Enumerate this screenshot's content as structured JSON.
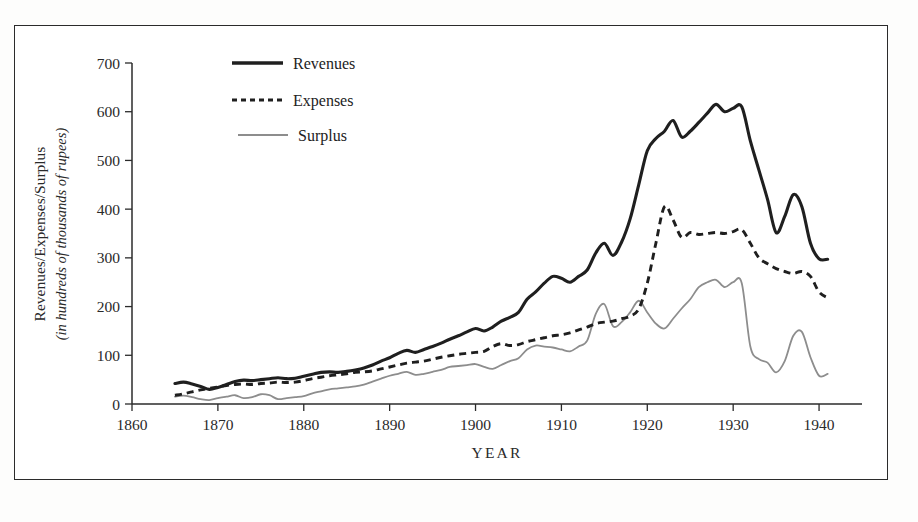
{
  "chart_data": {
    "type": "line",
    "title": "",
    "xlabel": "YEAR",
    "ylabel": "Revenues/Expenses/Surplus",
    "ylabel_sub": "(in hundreds of thousands of rupees)",
    "xlim": [
      1860,
      1945
    ],
    "ylim": [
      0,
      700
    ],
    "xticks": [
      1860,
      1870,
      1880,
      1890,
      1900,
      1910,
      1920,
      1930,
      1940
    ],
    "yticks": [
      0,
      100,
      200,
      300,
      400,
      500,
      600,
      700
    ],
    "grid": false,
    "legend_position": "top-center",
    "colors": {
      "revenues": "#1f1f1f",
      "expenses": "#1f1f1f",
      "surplus": "#8d8d8d",
      "axis": "#2b2b2b",
      "background": "#ffffff"
    },
    "x": [
      1865,
      1866,
      1867,
      1868,
      1869,
      1870,
      1871,
      1872,
      1873,
      1874,
      1875,
      1876,
      1877,
      1878,
      1879,
      1880,
      1881,
      1882,
      1883,
      1884,
      1885,
      1886,
      1887,
      1888,
      1889,
      1890,
      1891,
      1892,
      1893,
      1894,
      1895,
      1896,
      1897,
      1898,
      1899,
      1900,
      1901,
      1902,
      1903,
      1904,
      1905,
      1906,
      1907,
      1908,
      1909,
      1910,
      1911,
      1912,
      1913,
      1914,
      1915,
      1916,
      1917,
      1918,
      1919,
      1920,
      1921,
      1922,
      1923,
      1924,
      1925,
      1926,
      1927,
      1928,
      1929,
      1930,
      1931,
      1932,
      1933,
      1934,
      1935,
      1936,
      1937,
      1938,
      1939,
      1940,
      1941
    ],
    "series": [
      {
        "name": "Revenues",
        "style": "solid-thick",
        "values": [
          42,
          45,
          41,
          36,
          30,
          34,
          40,
          46,
          49,
          48,
          50,
          52,
          54,
          52,
          53,
          57,
          61,
          65,
          66,
          65,
          67,
          70,
          74,
          80,
          88,
          95,
          104,
          110,
          106,
          112,
          118,
          125,
          133,
          140,
          148,
          155,
          150,
          158,
          170,
          178,
          188,
          215,
          230,
          248,
          262,
          258,
          250,
          262,
          275,
          310,
          330,
          305,
          332,
          380,
          450,
          520,
          545,
          560,
          582,
          548,
          560,
          578,
          597,
          615,
          600,
          607,
          610,
          540,
          480,
          420,
          352,
          385,
          430,
          405,
          330,
          298,
          297
        ]
      },
      {
        "name": "Expenses",
        "style": "dashed",
        "values": [
          18,
          21,
          25,
          29,
          32,
          35,
          38,
          40,
          41,
          40,
          42,
          43,
          45,
          44,
          45,
          48,
          52,
          55,
          58,
          60,
          62,
          65,
          66,
          68,
          72,
          76,
          80,
          84,
          86,
          88,
          92,
          96,
          99,
          102,
          104,
          106,
          108,
          118,
          124,
          120,
          122,
          128,
          132,
          136,
          140,
          142,
          146,
          152,
          158,
          165,
          168,
          170,
          175,
          180,
          195,
          248,
          330,
          405,
          378,
          342,
          352,
          348,
          350,
          352,
          350,
          354,
          358,
          330,
          300,
          288,
          278,
          272,
          268,
          272,
          262,
          230,
          218
        ]
      },
      {
        "name": "Surplus",
        "style": "solid-thin",
        "values": [
          15,
          17,
          14,
          10,
          8,
          12,
          15,
          18,
          12,
          14,
          20,
          18,
          10,
          12,
          14,
          16,
          22,
          26,
          30,
          32,
          34,
          36,
          40,
          46,
          52,
          58,
          62,
          66,
          60,
          62,
          66,
          70,
          76,
          78,
          80,
          82,
          76,
          72,
          80,
          88,
          94,
          112,
          120,
          118,
          116,
          112,
          108,
          118,
          130,
          185,
          205,
          160,
          168,
          188,
          212,
          188,
          165,
          155,
          175,
          196,
          215,
          240,
          250,
          255,
          240,
          250,
          248,
          118,
          92,
          85,
          65,
          88,
          140,
          148,
          96,
          58,
          62
        ]
      }
    ],
    "legend": [
      {
        "label": "Revenues",
        "swatch": "solid-thick"
      },
      {
        "label": "Expenses",
        "swatch": "dashed"
      },
      {
        "label": "Surplus",
        "swatch": "solid-thin"
      }
    ]
  }
}
